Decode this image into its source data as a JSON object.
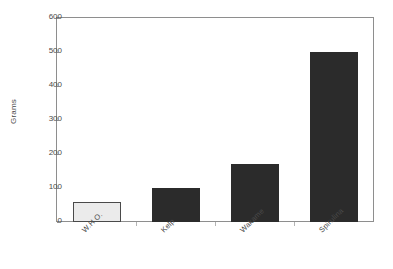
{
  "chart_data": {
    "type": "bar",
    "title": "",
    "subtitle": "",
    "xlabel": "",
    "ylabel": "Grams",
    "categories": [
      "W.H.O.",
      "Kelp",
      "Wakame",
      "Spirulina"
    ],
    "values": [
      58,
      100,
      170,
      500
    ],
    "ylim": [
      0,
      600
    ],
    "yticks": [
      0,
      100,
      200,
      300,
      400,
      500,
      600
    ],
    "ytick_labels": [
      "0",
      "100",
      "200",
      "300",
      "400",
      "500",
      "600"
    ],
    "grid": false,
    "legend": null,
    "legend_position": "none",
    "orientation": "vertical",
    "xtick_label_rotation": -45,
    "bar_colors": [
      "#ebebeb",
      "#2b2b2b",
      "#2b2b2b",
      "#2b2b2b"
    ],
    "bar_edge_colors": [
      "#4a4a4a",
      "#2b2b2b",
      "#2b2b2b",
      "#2b2b2b"
    ],
    "frame": "box",
    "frame_color": "#8e8e8e",
    "background": "#ffffff",
    "tick_direction": "in"
  }
}
